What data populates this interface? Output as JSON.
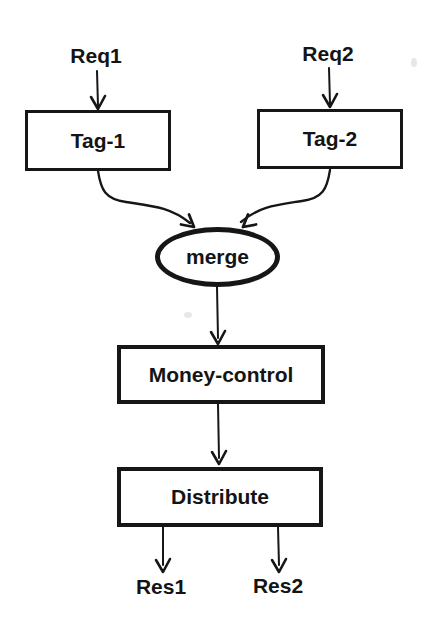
{
  "diagram": {
    "type": "flowchart",
    "background_color": "#ffffff",
    "ink_color": "#161616",
    "inputs": {
      "req1": "Req1",
      "req2": "Req2"
    },
    "nodes": {
      "tag1": {
        "label": "Tag-1",
        "shape": "rect"
      },
      "tag2": {
        "label": "Tag-2",
        "shape": "rect"
      },
      "merge": {
        "label": "merge",
        "shape": "ellipse"
      },
      "money_control": {
        "label": "Money-control",
        "shape": "rect"
      },
      "distribute": {
        "label": "Distribute",
        "shape": "rect"
      }
    },
    "outputs": {
      "res1": "Res1",
      "res2": "Res2"
    },
    "edges": [
      {
        "from": "Req1",
        "to": "Tag-1"
      },
      {
        "from": "Req2",
        "to": "Tag-2"
      },
      {
        "from": "Tag-1",
        "to": "merge"
      },
      {
        "from": "Tag-2",
        "to": "merge"
      },
      {
        "from": "merge",
        "to": "Money-control"
      },
      {
        "from": "Money-control",
        "to": "Distribute"
      },
      {
        "from": "Distribute",
        "to": "Res1"
      },
      {
        "from": "Distribute",
        "to": "Res2"
      }
    ]
  }
}
